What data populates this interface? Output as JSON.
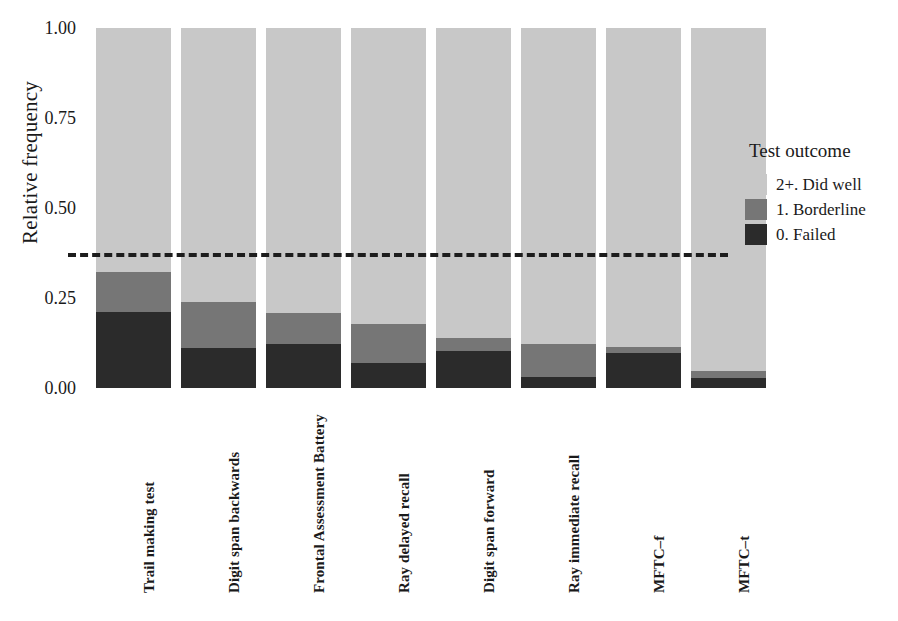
{
  "chart_data": {
    "type": "bar",
    "subtype": "stacked-proportional",
    "title": "",
    "xlabel": "",
    "ylabel": "Relative frequency",
    "ylim": [
      0,
      1
    ],
    "ytick_labels": [
      "0.00",
      "0.25",
      "0.50",
      "0.75",
      "1.00"
    ],
    "ytick_values": [
      0,
      0.25,
      0.5,
      0.75,
      1.0
    ],
    "grid": false,
    "legend_position": "right",
    "legend_title": "Test outcome",
    "categories": [
      "Trail making test",
      "Digit span backwards",
      "Frontal Assessment Battery",
      "Ray delayed recall",
      "Digit span forward",
      "Ray immediate recall",
      "MFTC–f",
      "MFTC–t"
    ],
    "series": [
      {
        "name": "0. Failed",
        "color": "#2b2b2b",
        "values": [
          0.211,
          0.111,
          0.122,
          0.069,
          0.103,
          0.031,
          0.097,
          0.028
        ]
      },
      {
        "name": "1. Borderline",
        "color": "#767676",
        "values": [
          0.111,
          0.128,
          0.086,
          0.109,
          0.036,
          0.091,
          0.017,
          0.019
        ]
      },
      {
        "name": "2+. Did well",
        "color": "#c8c8c8",
        "values": [
          0.678,
          0.761,
          0.792,
          0.822,
          0.861,
          0.878,
          0.886,
          0.953
        ]
      }
    ],
    "annotations": [
      {
        "type": "hline",
        "value": 0.375,
        "style": "dashed",
        "color": "#1d1d1d",
        "label": ""
      }
    ]
  },
  "legend": {
    "title": "Test outcome",
    "items": [
      {
        "label": "2+. Did well",
        "color": "#c8c8c8"
      },
      {
        "label": "1. Borderline",
        "color": "#767676"
      },
      {
        "label": "0. Failed",
        "color": "#2b2b2b"
      }
    ]
  }
}
